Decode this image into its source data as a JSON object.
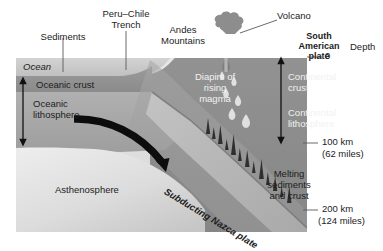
{
  "diagram": {
    "type": "geological-cross-section",
    "palette": {
      "background": "#ffffff",
      "ocean_water": "#c9c9c9",
      "oceanic_crust": "#8f8f8f",
      "oceanic_lithosphere": "#a8a8a8",
      "asthenosphere": "#d8d8d8",
      "continental_crust": "#8a8a8a",
      "continental_lithosphere": "#9d9d9d",
      "subducting_slab": "#b4b4b4",
      "mountain": "#9a9a9a",
      "ash_cloud": "#8e8e8e",
      "text_dark": "#1c1c1c",
      "text_light": "#f2f2f2",
      "leader_line": "#555555"
    },
    "labels": {
      "sediments": "Sediments",
      "peru_chile_trench_line1": "Peru–Chile",
      "peru_chile_trench_line2": "Trench",
      "andes_line1": "Andes",
      "andes_line2": "Mountains",
      "volcano": "Volcano",
      "south_american_plate_line1": "South",
      "south_american_plate_line2": "American",
      "south_american_plate_line3": "plate",
      "depth": "Depth",
      "ocean": "Ocean",
      "oceanic_crust": "Oceanic crust",
      "oceanic_lithosphere_line1": "Oceanic",
      "oceanic_lithosphere_line2": "lithosphere",
      "diapirs_line1": "Diapirs of",
      "diapirs_line2": "rising",
      "diapirs_line3": "magma",
      "continental_crust_line1": "Continental",
      "continental_crust_line2": "crust",
      "continental_lithosphere_line1": "Continental",
      "continental_lithosphere_line2": "lithosphere",
      "asthenosphere": "Asthenosphere",
      "subducting_nazca_plate": "Subducting Nazca plate",
      "melting_line1": "Melting",
      "melting_line2": "sediments",
      "melting_line3": "and crust"
    },
    "depth_scale": {
      "ticks": [
        {
          "value": "0",
          "sub": ""
        },
        {
          "value": "100 km",
          "sub": "(62 miles)"
        },
        {
          "value": "200 km",
          "sub": "(124 miles)"
        }
      ]
    }
  }
}
